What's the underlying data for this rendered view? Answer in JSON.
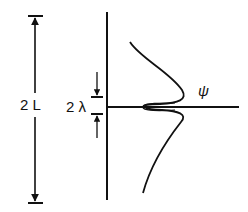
{
  "diagram": {
    "labels": {
      "length": "2 L",
      "gap": "2 λ",
      "wavefunction": "ψ"
    },
    "colors": {
      "stroke": "#111111",
      "background": "#ffffff"
    }
  }
}
